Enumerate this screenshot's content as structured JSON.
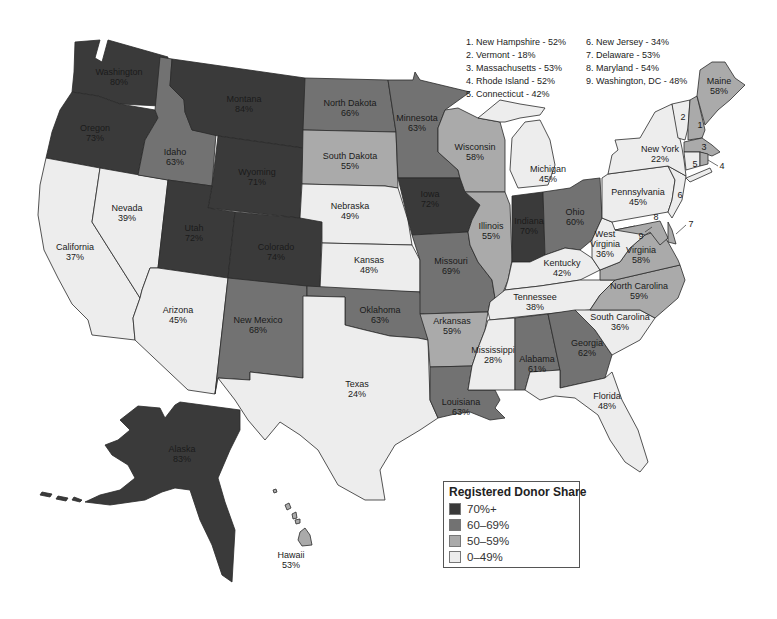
{
  "colors": {
    "bin_70_plus": "#3a3a3a",
    "bin_60_69": "#727272",
    "bin_50_59": "#aaaaaa",
    "bin_0_49": "#ededed",
    "border": "#2a2a2a"
  },
  "legend": {
    "title": "Registered Donor Share",
    "items": [
      {
        "label": "70%+",
        "color": "#3a3a3a"
      },
      {
        "label": "60–69%",
        "color": "#727272"
      },
      {
        "label": "50–59%",
        "color": "#aaaaaa"
      },
      {
        "label": "0–49%",
        "color": "#ededed"
      }
    ]
  },
  "footnotes": {
    "left": [
      "1. New Hampshire - 52%",
      "2. Vermont - 18%",
      "3. Massachusetts - 53%",
      "4. Rhode Island - 52%",
      "5. Connecticut - 42%"
    ],
    "right": [
      "6. New Jersey - 34%",
      "7. Delaware - 53%",
      "8. Maryland - 54%",
      "9. Washington, DC - 48%"
    ]
  },
  "states": {
    "washington": {
      "name": "Washington",
      "value": "80%"
    },
    "oregon": {
      "name": "Oregon",
      "value": "73%"
    },
    "california": {
      "name": "California",
      "value": "37%"
    },
    "nevada": {
      "name": "Nevada",
      "value": "39%"
    },
    "idaho": {
      "name": "Idaho",
      "value": "63%"
    },
    "montana": {
      "name": "Montana",
      "value": "84%"
    },
    "wyoming": {
      "name": "Wyoming",
      "value": "71%"
    },
    "utah": {
      "name": "Utah",
      "value": "72%"
    },
    "colorado": {
      "name": "Colorado",
      "value": "74%"
    },
    "arizona": {
      "name": "Arizona",
      "value": "45%"
    },
    "new_mexico": {
      "name": "New Mexico",
      "value": "68%"
    },
    "north_dakota": {
      "name": "North Dakota",
      "value": "66%"
    },
    "south_dakota": {
      "name": "South Dakota",
      "value": "55%"
    },
    "nebraska": {
      "name": "Nebraska",
      "value": "49%"
    },
    "kansas": {
      "name": "Kansas",
      "value": "48%"
    },
    "oklahoma": {
      "name": "Oklahoma",
      "value": "63%"
    },
    "texas": {
      "name": "Texas",
      "value": "24%"
    },
    "minnesota": {
      "name": "Minnesota",
      "value": "63%"
    },
    "iowa": {
      "name": "Iowa",
      "value": "72%"
    },
    "missouri": {
      "name": "Missouri",
      "value": "69%"
    },
    "arkansas": {
      "name": "Arkansas",
      "value": "59%"
    },
    "louisiana": {
      "name": "Louisiana",
      "value": "63%"
    },
    "wisconsin": {
      "name": "Wisconsin",
      "value": "58%"
    },
    "illinois": {
      "name": "Illinois",
      "value": "55%"
    },
    "michigan": {
      "name": "Michigan",
      "value": "45%"
    },
    "indiana": {
      "name": "Indiana",
      "value": "70%"
    },
    "ohio": {
      "name": "Ohio",
      "value": "60%"
    },
    "kentucky": {
      "name": "Kentucky",
      "value": "42%"
    },
    "tennessee": {
      "name": "Tennessee",
      "value": "38%"
    },
    "mississippi": {
      "name": "Mississippi",
      "value": "28%"
    },
    "alabama": {
      "name": "Alabama",
      "value": "61%"
    },
    "georgia": {
      "name": "Georgia",
      "value": "62%"
    },
    "florida": {
      "name": "Florida",
      "value": "48%"
    },
    "south_carolina": {
      "name": "South Carolina",
      "value": "36%"
    },
    "north_carolina": {
      "name": "North Carolina",
      "value": "59%"
    },
    "virginia": {
      "name": "Virginia",
      "value": "58%"
    },
    "west_virginia_1": {
      "name": "West",
      "value": ""
    },
    "west_virginia": {
      "name": "Virginia",
      "value": "36%"
    },
    "pennsylvania": {
      "name": "Pennsylvania",
      "value": "45%"
    },
    "new_york": {
      "name": "New York",
      "value": "22%"
    },
    "maine": {
      "name": "Maine",
      "value": "58%"
    },
    "alaska": {
      "name": "Alaska",
      "value": "83%"
    },
    "hawaii": {
      "name": "Hawaii",
      "value": "53%"
    }
  },
  "small_state_markers": [
    "1",
    "2",
    "3",
    "4",
    "5",
    "6",
    "7",
    "8",
    "9"
  ]
}
